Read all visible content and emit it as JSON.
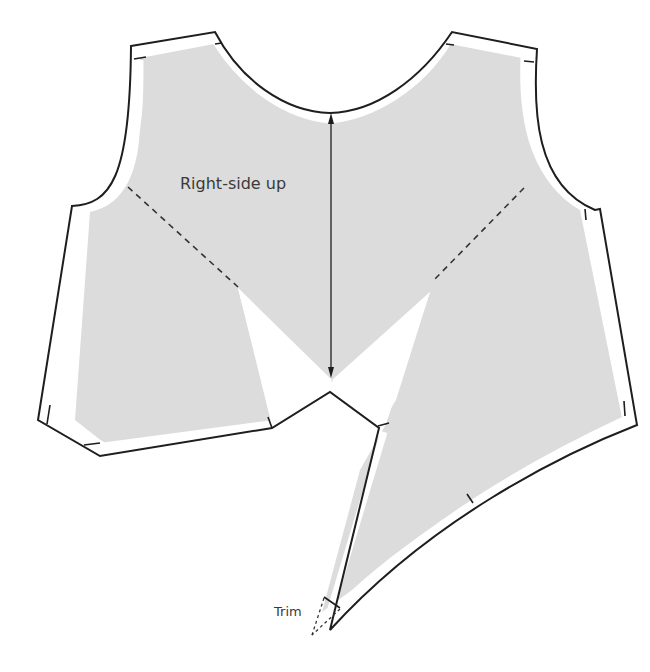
{
  "diagram": {
    "labels": {
      "grain": "Right-side up",
      "trim": "Trim"
    },
    "colors": {
      "fabric_fill": "#dcdcdc",
      "outline": "#1e1e1e",
      "label_text": "#3a3a3a",
      "background": "#ffffff"
    },
    "elements": [
      "cutting-outline",
      "seam-allowance-band",
      "fabric-shaded-area",
      "dart-fold-lines",
      "grainline-arrow",
      "trim-point"
    ]
  }
}
